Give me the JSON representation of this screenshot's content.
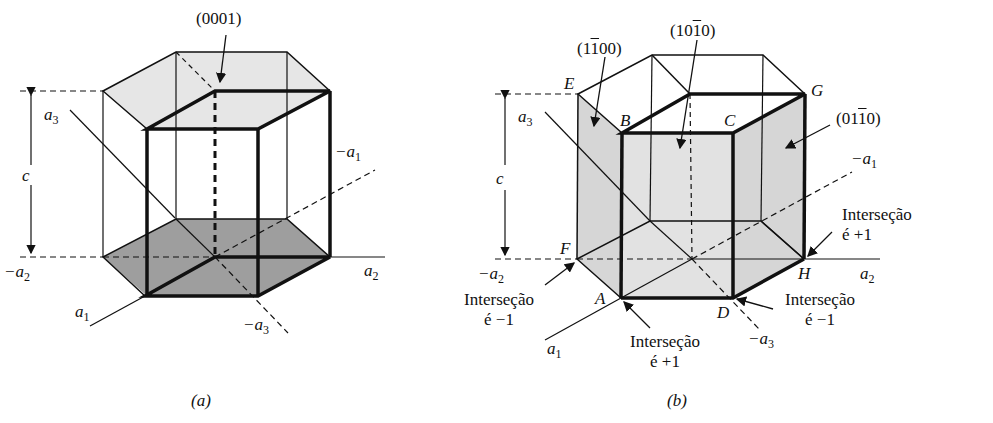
{
  "figure": {
    "panel_a": {
      "caption": "(a)",
      "plane_label": "(0001)",
      "axes": {
        "a1": "a",
        "a1_sub": "1",
        "minus_a1": "−a",
        "minus_a1_sub": "1",
        "a2": "a",
        "a2_sub": "2",
        "minus_a2": "−a",
        "minus_a2_sub": "2",
        "a3": "a",
        "a3_sub": "3",
        "minus_a3": "−a",
        "minus_a3_sub": "3",
        "c": "c"
      }
    },
    "panel_b": {
      "caption": "(b)",
      "plane_labels": {
        "p1_pre": "(1",
        "p1_bar": "1",
        "p1_post": "00)",
        "p2_pre": "(10",
        "p2_bar": "1",
        "p2_post": "0)",
        "p3_pre": "(01",
        "p3_bar": "1",
        "p3_post": "0)"
      },
      "vertices": {
        "A": "A",
        "B": "B",
        "C": "C",
        "D": "D",
        "E": "E",
        "F": "F",
        "G": "G",
        "H": "H"
      },
      "axes": {
        "a1": "a",
        "a1_sub": "1",
        "minus_a1": "−a",
        "minus_a1_sub": "1",
        "a2": "a",
        "a2_sub": "2",
        "minus_a2": "−a",
        "minus_a2_sub": "2",
        "a3": "a",
        "a3_sub": "3",
        "minus_a3": "−a",
        "minus_a3_sub": "3",
        "c": "c"
      },
      "annotations": {
        "F": {
          "line1": "Interseção",
          "line2": "é −1"
        },
        "A": {
          "line1": "Interseção",
          "line2": "é +1"
        },
        "D": {
          "line1": "Interseção",
          "line2": "é −1"
        },
        "H": {
          "line1": "Interseção",
          "line2": "é +1"
        }
      }
    },
    "colors": {
      "line": "#111111",
      "fill_light": "#e4e4e4",
      "fill_dark": "#9a9a9a"
    }
  }
}
